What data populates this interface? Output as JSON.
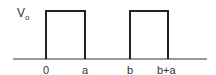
{
  "diagram": {
    "type": "pulse-train",
    "y_label": "V",
    "y_label_sub": "o",
    "x_labels": [
      "0",
      "a",
      "b",
      "b+a"
    ],
    "pulses": [
      {
        "start": "0",
        "end": "a",
        "height": "Vo"
      },
      {
        "start": "b",
        "end": "b+a",
        "height": "Vo"
      }
    ],
    "line_color": "#222222"
  }
}
